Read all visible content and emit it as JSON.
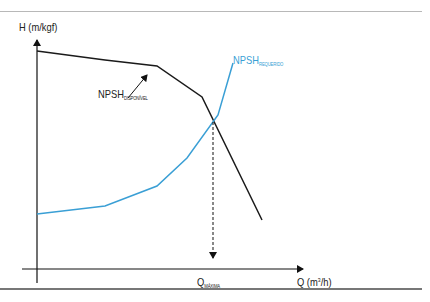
{
  "chart_data": {
    "type": "line",
    "title": "",
    "xlabel": "Q (m³/h)",
    "ylabel": "H (m/kgf)",
    "grid": false,
    "legend": "inline labels",
    "series": [
      {
        "name": "NPSH disponível",
        "label_main": "NPSH",
        "label_sub": "DISPONÍVEL",
        "color": "#1a1a1a",
        "points_px": [
          [
            37,
            51
          ],
          [
            105,
            60
          ],
          [
            157,
            66
          ],
          [
            202,
            97
          ],
          [
            262,
            220
          ]
        ],
        "x": [
          0,
          0.27,
          0.48,
          0.66,
          0.9
        ],
        "y": [
          1.0,
          0.96,
          0.93,
          0.79,
          0.23
        ]
      },
      {
        "name": "NPSH requerido",
        "label_main": "NPSH",
        "label_sub": "REQUERIDO",
        "color": "#3a9fd5",
        "points_px": [
          [
            37,
            214
          ],
          [
            105,
            206
          ],
          [
            157,
            186
          ],
          [
            187,
            158
          ],
          [
            218,
            115
          ],
          [
            233,
            63
          ]
        ],
        "x": [
          0,
          0.27,
          0.48,
          0.6,
          0.72,
          0.78
        ],
        "y": [
          0.26,
          0.29,
          0.38,
          0.51,
          0.7,
          0.94
        ]
      }
    ],
    "annotations": [
      {
        "type": "intersection-marker",
        "label_main": "Q",
        "label_sub": "MÁXIMA",
        "x_px": 213,
        "description": "dashed vertical arrow from intersection down to x-axis"
      },
      {
        "type": "arrow",
        "from_px": [
          128,
          98
        ],
        "to_px": [
          148,
          73
        ],
        "points_to": "NPSH disponível curve"
      }
    ]
  },
  "labels": {
    "y_axis": "H (m/kgf)",
    "x_axis_main": "Q (m",
    "x_axis_sup": "3",
    "x_axis_tail": "/h)",
    "npsh_disp_main": "NPSH",
    "npsh_disp_sub": "DISPONÍVEL",
    "npsh_req_main": "NPSH",
    "npsh_req_sub": "REQUERIDO",
    "q_max_main": "Q",
    "q_max_sub": "MÁXIMA"
  },
  "colors": {
    "available": "#1a1a1a",
    "required": "#3a9fd5",
    "axis": "#111111"
  }
}
